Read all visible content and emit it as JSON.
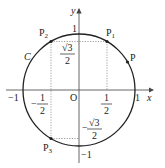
{
  "diagram": {
    "type": "unit-circle",
    "curve_label": "C",
    "axes": {
      "x_label": "x",
      "y_label": "y",
      "origin_label": "O"
    },
    "tick_labels": {
      "x_pos_one": "1",
      "x_neg_one": "−1",
      "x_pos_half_num": "1",
      "x_pos_half_den": "2",
      "x_neg_half_sign": "−",
      "x_neg_half_num": "1",
      "x_neg_half_den": "2",
      "y_pos_one": "1",
      "y_neg_one": "−1",
      "y_pos_root_num": "√3",
      "y_pos_root_den": "2",
      "y_neg_root_sign": "−",
      "y_neg_root_num": "√3",
      "y_neg_root_den": "2"
    },
    "points": [
      {
        "id": "P",
        "label": "P",
        "sub": "",
        "coords": "(cos θ, sin θ) ≈ 30°"
      },
      {
        "id": "P1",
        "label": "P",
        "sub": "1",
        "coords": "(1/2, √3/2)"
      },
      {
        "id": "P2",
        "label": "P",
        "sub": "2",
        "coords": "(−1/2, √3/2)"
      },
      {
        "id": "P3",
        "label": "P",
        "sub": "3",
        "coords": "(−1/2, −√3/2)"
      }
    ],
    "colors": {
      "stroke": "#222222",
      "dotted": "#888888"
    }
  }
}
